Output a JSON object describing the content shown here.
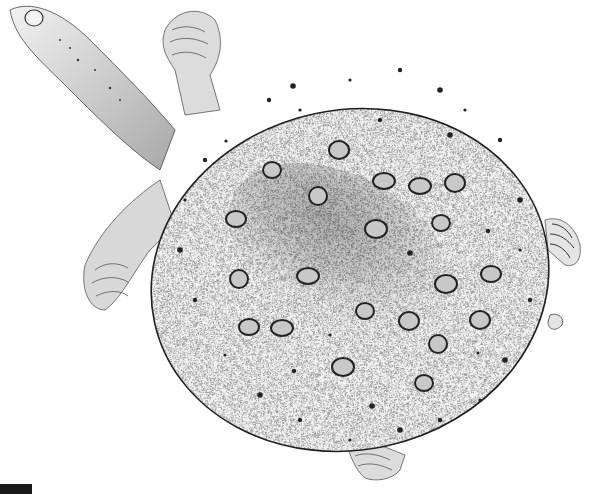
{
  "image": {
    "subject": "Stippled illustration of a softshell turtle viewed from above",
    "style": "black ink stipple on white",
    "colors": {
      "background": "#ffffff",
      "ink": "#1a1a1a",
      "shell_fill": "#e9e9e9",
      "shell_shadow": "#9a9a9a",
      "spot_fill": "#c8c8c8",
      "spot_outline": "#222222"
    },
    "shell": {
      "cx": 350,
      "cy": 280,
      "rx": 200,
      "ry": 170,
      "rotation": -12,
      "ocelli": [
        [
          272,
          170
        ],
        [
          339,
          150
        ],
        [
          384,
          181
        ],
        [
          318,
          196
        ],
        [
          236,
          219
        ],
        [
          376,
          229
        ],
        [
          441,
          223
        ],
        [
          455,
          183
        ],
        [
          308,
          276
        ],
        [
          239,
          279
        ],
        [
          491,
          274
        ],
        [
          446,
          284
        ],
        [
          365,
          311
        ],
        [
          409,
          321
        ],
        [
          282,
          328
        ],
        [
          438,
          344
        ],
        [
          249,
          327
        ],
        [
          343,
          367
        ],
        [
          424,
          383
        ],
        [
          480,
          320
        ],
        [
          420,
          186
        ]
      ],
      "dots": [
        [
          226,
          141
        ],
        [
          269,
          100
        ],
        [
          293,
          86
        ],
        [
          350,
          80
        ],
        [
          400,
          70
        ],
        [
          440,
          90
        ],
        [
          465,
          110
        ],
        [
          500,
          140
        ],
        [
          520,
          200
        ],
        [
          520,
          250
        ],
        [
          530,
          300
        ],
        [
          505,
          360
        ],
        [
          480,
          400
        ],
        [
          440,
          420
        ],
        [
          400,
          430
        ],
        [
          350,
          440
        ],
        [
          300,
          420
        ],
        [
          260,
          395
        ],
        [
          225,
          355
        ],
        [
          195,
          300
        ],
        [
          180,
          250
        ],
        [
          185,
          200
        ],
        [
          205,
          160
        ],
        [
          410,
          253
        ],
        [
          330,
          335
        ],
        [
          294,
          371
        ],
        [
          372,
          406
        ],
        [
          478,
          353
        ],
        [
          488,
          231
        ],
        [
          450,
          135
        ],
        [
          300,
          110
        ],
        [
          380,
          120
        ]
      ]
    }
  },
  "caption": {
    "label": ""
  }
}
